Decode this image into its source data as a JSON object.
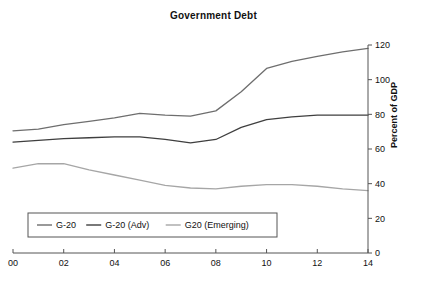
{
  "chart_data": {
    "type": "line",
    "title": "Government Debt",
    "xlabel": "",
    "ylabel": "Percent of GDP",
    "xlim": [
      0,
      14
    ],
    "ylim": [
      0,
      120
    ],
    "ytick_step": 20,
    "xtick_step": 2,
    "grid": false,
    "legend_position": "bottom-left",
    "x": [
      0,
      1,
      2,
      3,
      4,
      5,
      6,
      7,
      8,
      9,
      10,
      11,
      12,
      13,
      14
    ],
    "xticklabels": [
      "00",
      "02",
      "04",
      "06",
      "08",
      "10",
      "12",
      "14"
    ],
    "xtickvalues": [
      0,
      2,
      4,
      6,
      8,
      10,
      12,
      14
    ],
    "yticklabels": [
      "0",
      "20",
      "40",
      "60",
      "80",
      "100",
      "120"
    ],
    "ytickvalues": [
      0,
      20,
      40,
      60,
      80,
      100,
      120
    ],
    "series": [
      {
        "name": "G-20",
        "color": "#6e6e6e",
        "width": 1.3,
        "values": [
          70.5,
          71.5,
          74.0,
          76.0,
          78.0,
          80.5,
          79.5,
          79.0,
          82.0,
          93.0,
          106.5,
          110.5,
          113.5,
          116.0,
          118.0
        ]
      },
      {
        "name": "G-20 (Adv)",
        "color": "#3f3f3f",
        "width": 1.3,
        "values": [
          64.0,
          65.0,
          66.0,
          66.5,
          67.0,
          67.0,
          65.5,
          63.5,
          65.5,
          72.5,
          77.0,
          78.5,
          79.5,
          79.5,
          79.5
        ]
      },
      {
        "name": "G20 (Emerging)",
        "color": "#a6a6a6",
        "width": 1.3,
        "values": [
          49.0,
          51.5,
          51.5,
          48.0,
          45.0,
          42.0,
          39.0,
          37.5,
          37.0,
          38.5,
          39.5,
          39.5,
          38.5,
          37.0,
          36.0
        ]
      }
    ]
  },
  "legend": {
    "entries": [
      {
        "label": "G-20",
        "color": "#6e6e6e"
      },
      {
        "label": "G-20 (Adv)",
        "color": "#3f3f3f"
      },
      {
        "label": "G20 (Emerging)",
        "color": "#a6a6a6"
      }
    ]
  },
  "axis": {
    "y_axis_title": "Percent of GDP"
  }
}
